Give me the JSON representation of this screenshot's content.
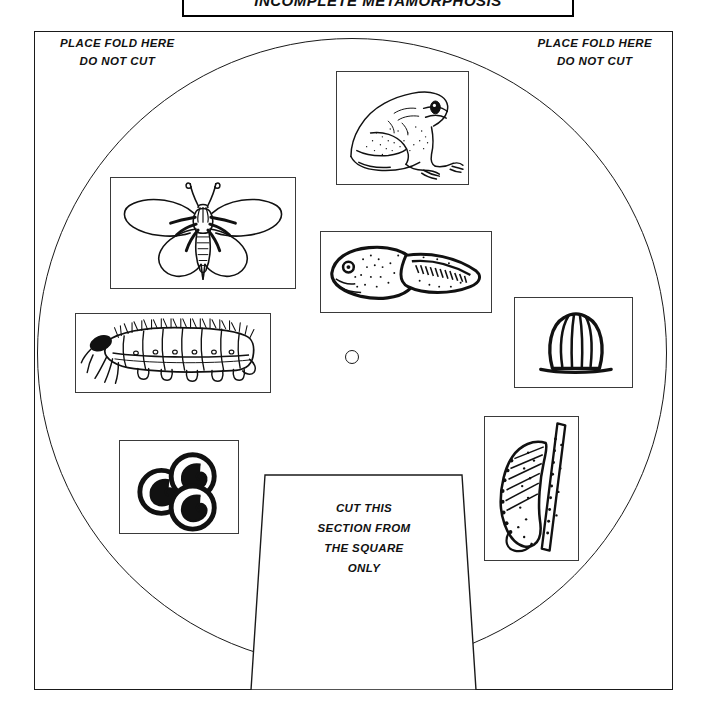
{
  "page": {
    "title": "INCOMPLETE METAMORPHOSIS",
    "background_color": "#ffffff",
    "line_color": "#1a1a1a",
    "width": 707,
    "height": 723
  },
  "title_box": {
    "label": "INCOMPLETE METAMORPHOSIS"
  },
  "fold_labels": {
    "left": {
      "line1": "PLACE FOLD HERE",
      "line2": "DO NOT CUT"
    },
    "right": {
      "line1": "PLACE FOLD HERE",
      "line2": "DO NOT CUT"
    }
  },
  "cut_section": {
    "line1": "CUT THIS",
    "line2": "SECTION FROM",
    "line3": "THE SQUARE",
    "line4": "ONLY"
  },
  "pictures": [
    {
      "id": "frog",
      "name": "adult-frog",
      "caption": ""
    },
    {
      "id": "butterfly",
      "name": "adult-moth",
      "caption": ""
    },
    {
      "id": "tadpole",
      "name": "tadpole",
      "caption": ""
    },
    {
      "id": "egg-insect",
      "name": "insect-egg",
      "caption": ""
    },
    {
      "id": "larva",
      "name": "caterpillar-larva",
      "caption": ""
    },
    {
      "id": "eggs-frog",
      "name": "frog-egg-cluster",
      "caption": ""
    },
    {
      "id": "pupa",
      "name": "chrysalis-pupa",
      "caption": ""
    }
  ],
  "center_hole": {
    "label": ""
  }
}
